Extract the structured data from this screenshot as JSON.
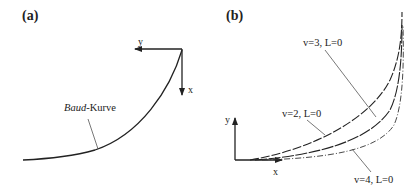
{
  "panels": [
    {
      "id": "a",
      "label": "(a)",
      "axes": {
        "x_label": "x",
        "y_label": "y"
      },
      "curve_label_italic": "Baud",
      "curve_label_rest": "-Kurve"
    },
    {
      "id": "b",
      "label": "(b)",
      "axes": {
        "x_label": "x",
        "y_label": "y"
      },
      "curves": [
        {
          "label": "v=3, L=0",
          "style": "solid"
        },
        {
          "label": "v=2, L=0",
          "style": "dashed"
        },
        {
          "label": "v=4, L=0",
          "style": "dash-dot"
        }
      ]
    }
  ],
  "colors": {
    "line": "#222222",
    "leader": "#555555",
    "background": "#ffffff"
  }
}
